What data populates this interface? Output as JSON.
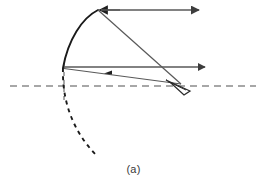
{
  "figure": {
    "caption": "(a)",
    "label": "(a)",
    "background_color": "#ffffff",
    "width": 267,
    "height": 190
  },
  "colors": {
    "mirror_stroke": "#1a1a1a",
    "ray_stroke": "#595959",
    "axis_stroke": "#8a8a8a",
    "dashed_curve_stroke": "#1a1a1a",
    "eye_stroke": "#2a2a2a",
    "caption_text": "#3a3a3a"
  },
  "chart_data": {
    "type": "diagram",
    "title": "(a)",
    "subtitle": "",
    "xlabel": "",
    "ylabel": "",
    "elements": [
      {
        "name": "optical-axis",
        "kind": "dashed-line",
        "style": "dashed",
        "color": "#8a8a8a",
        "from": [
          10,
          86
        ],
        "to": [
          256,
          86
        ]
      },
      {
        "name": "vertex-normal",
        "kind": "dashed-line",
        "style": "dashed",
        "color": "#8a8a8a",
        "from": [
          64,
          64
        ],
        "to": [
          64,
          100
        ]
      },
      {
        "name": "mirror-surface",
        "kind": "arc",
        "style": "solid",
        "color": "#1a1a1a",
        "path": "M 98 10 C 82 18 68 40 63 68"
      },
      {
        "name": "mirror-surface-extension",
        "kind": "arc",
        "style": "dashed",
        "color": "#1a1a1a",
        "path": "M 63 68 C 62 100 72 130 96 155"
      },
      {
        "name": "upper-incident-ray",
        "kind": "ray",
        "style": "solid",
        "color": "#595959",
        "from": [
          200,
          10
        ],
        "to": [
          98,
          10
        ],
        "arrow_at": "both",
        "arrow_directions": [
          "left",
          "right"
        ]
      },
      {
        "name": "upper-reflected-ray",
        "kind": "ray",
        "style": "solid",
        "color": "#595959",
        "from": [
          98,
          10
        ],
        "to": [
          181,
          84
        ],
        "arrow_at": "none"
      },
      {
        "name": "lower-incident-ray",
        "kind": "ray",
        "style": "solid",
        "color": "#595959",
        "from": [
          64,
          67
        ],
        "to": [
          205,
          67
        ],
        "arrow_at": "end",
        "arrow_directions": [
          "right"
        ]
      },
      {
        "name": "lower-reflected-ray",
        "kind": "ray",
        "style": "solid",
        "color": "#595959",
        "from": [
          180,
          84
        ],
        "to": [
          64,
          68
        ],
        "arrow_at": "mid",
        "arrow_directions": [
          "left"
        ]
      },
      {
        "name": "observer-eye",
        "kind": "eye-symbol",
        "style": "solid",
        "color": "#2a2a2a",
        "position": [
          182,
          86
        ],
        "path": "M 166 80 L 190 91 L 184 95 L 171 83 Z"
      }
    ],
    "grid": false,
    "legend": null
  },
  "accessibility": {
    "alt_text": "Concave mirror ray diagram labeled (a)"
  }
}
